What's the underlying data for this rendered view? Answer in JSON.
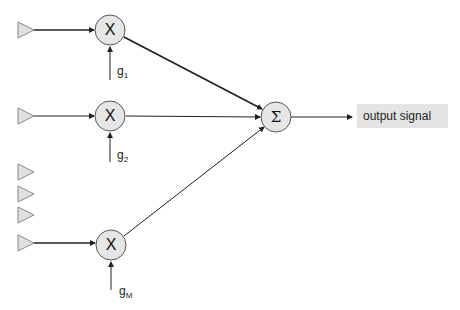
{
  "diagram": {
    "type": "beamforming / weighted sum signal flow",
    "inputs": [
      {
        "id": "input-1",
        "connected": true
      },
      {
        "id": "input-2",
        "connected": true
      },
      {
        "id": "input-3",
        "connected": false
      },
      {
        "id": "input-4",
        "connected": false
      },
      {
        "id": "input-5",
        "connected": false
      },
      {
        "id": "input-M",
        "connected": true
      }
    ],
    "multipliers": [
      {
        "symbol": "X",
        "gain": "g",
        "gain_sub": "1"
      },
      {
        "symbol": "X",
        "gain": "g",
        "gain_sub": "2"
      },
      {
        "symbol": "X",
        "gain": "g",
        "gain_sub": "M"
      }
    ],
    "summer": {
      "symbol": "Σ"
    },
    "output": {
      "label": "output signal"
    }
  },
  "colors": {
    "node_fill": "#e6e6e6",
    "triangle_fill": "#e0e0e0",
    "stroke": "#222222",
    "output_box": "#e4e4e4"
  }
}
